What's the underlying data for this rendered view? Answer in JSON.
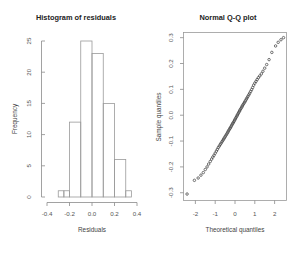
{
  "figure": {
    "width": 304,
    "height": 272,
    "background": "#ffffff",
    "panel_count": 2
  },
  "chart_data": [
    {
      "type": "bar",
      "name": "histogram-residuals",
      "title": "Histogram of residuals",
      "xlabel": "Residuals",
      "ylabel": "Frequency",
      "xlim": [
        -0.4,
        0.4
      ],
      "ylim": [
        0,
        25
      ],
      "xticks": [
        -0.4,
        -0.2,
        0.0,
        0.2,
        0.4
      ],
      "xticklabels": [
        "-0.4",
        "-0.2",
        "0.0",
        "0.2",
        "0.4"
      ],
      "yticks": [
        0,
        5,
        10,
        15,
        20,
        25
      ],
      "yticklabels": [
        "0",
        "5",
        "10",
        "15",
        "20",
        "25"
      ],
      "grid": false,
      "bin_edges": [
        -0.3,
        -0.25,
        -0.2,
        -0.15,
        -0.1,
        -0.05,
        0.0,
        0.05,
        0.1,
        0.15,
        0.2,
        0.25,
        0.3,
        0.35
      ],
      "bins": [
        {
          "left": -0.3,
          "right": -0.25,
          "count": 1
        },
        {
          "left": -0.25,
          "right": -0.2,
          "count": 1
        },
        {
          "left": -0.2,
          "right": -0.1,
          "count": 12
        },
        {
          "left": -0.1,
          "right": 0.0,
          "count": 25
        },
        {
          "left": 0.0,
          "right": 0.1,
          "count": 23
        },
        {
          "left": 0.1,
          "right": 0.2,
          "count": 15
        },
        {
          "left": 0.2,
          "right": 0.3,
          "count": 6
        },
        {
          "left": 0.3,
          "right": 0.35,
          "count": 1
        }
      ],
      "categories": [
        "-0.275",
        "-0.15",
        "-0.05",
        "0.05",
        "0.15",
        "0.25",
        "0.325"
      ],
      "values": [
        1,
        12,
        25,
        23,
        15,
        6,
        1
      ]
    },
    {
      "type": "scatter",
      "name": "normal-qq-plot",
      "title": "Normal Q-Q plot",
      "xlabel": "Theoretical quantiles",
      "ylabel": "Sample quantiles",
      "xlim": [
        -2.6,
        2.6
      ],
      "ylim": [
        -0.33,
        0.32
      ],
      "xticks": [
        -2,
        -1,
        0,
        1,
        2
      ],
      "xticklabels": [
        "-2",
        "-1",
        "0",
        "1",
        "2"
      ],
      "yticks": [
        -0.3,
        -0.2,
        -0.1,
        0.0,
        0.1,
        0.2,
        0.3
      ],
      "yticklabels": [
        "-0.3",
        "-0.2",
        "-0.1",
        "0.0",
        "0.1",
        "0.2",
        "0.3"
      ],
      "grid": false,
      "frame": true,
      "marker": "open-circle",
      "points": [
        [
          -2.42,
          -0.305
        ],
        [
          -2.05,
          -0.252
        ],
        [
          -1.86,
          -0.243
        ],
        [
          -1.72,
          -0.232
        ],
        [
          -1.6,
          -0.222
        ],
        [
          -1.5,
          -0.21
        ],
        [
          -1.41,
          -0.2
        ],
        [
          -1.33,
          -0.189
        ],
        [
          -1.25,
          -0.179
        ],
        [
          -1.18,
          -0.17
        ],
        [
          -1.12,
          -0.162
        ],
        [
          -1.06,
          -0.155
        ],
        [
          -1.0,
          -0.147
        ],
        [
          -0.94,
          -0.139
        ],
        [
          -0.89,
          -0.132
        ],
        [
          -0.84,
          -0.125
        ],
        [
          -0.79,
          -0.119
        ],
        [
          -0.74,
          -0.113
        ],
        [
          -0.7,
          -0.108
        ],
        [
          -0.65,
          -0.102
        ],
        [
          -0.61,
          -0.097
        ],
        [
          -0.57,
          -0.092
        ],
        [
          -0.53,
          -0.087
        ],
        [
          -0.49,
          -0.082
        ],
        [
          -0.45,
          -0.077
        ],
        [
          -0.41,
          -0.072
        ],
        [
          -0.37,
          -0.067
        ],
        [
          -0.34,
          -0.062
        ],
        [
          -0.3,
          -0.057
        ],
        [
          -0.26,
          -0.052
        ],
        [
          -0.23,
          -0.048
        ],
        [
          -0.19,
          -0.043
        ],
        [
          -0.16,
          -0.038
        ],
        [
          -0.12,
          -0.033
        ],
        [
          -0.09,
          -0.029
        ],
        [
          -0.05,
          -0.024
        ],
        [
          -0.02,
          -0.019
        ],
        [
          0.02,
          -0.014
        ],
        [
          0.05,
          -0.009
        ],
        [
          0.09,
          -0.004
        ],
        [
          0.12,
          0.001
        ],
        [
          0.16,
          0.006
        ],
        [
          0.19,
          0.011
        ],
        [
          0.23,
          0.016
        ],
        [
          0.26,
          0.021
        ],
        [
          0.3,
          0.026
        ],
        [
          0.34,
          0.031
        ],
        [
          0.37,
          0.036
        ],
        [
          0.41,
          0.041
        ],
        [
          0.45,
          0.046
        ],
        [
          0.49,
          0.051
        ],
        [
          0.53,
          0.056
        ],
        [
          0.57,
          0.062
        ],
        [
          0.61,
          0.067
        ],
        [
          0.65,
          0.073
        ],
        [
          0.7,
          0.079
        ],
        [
          0.74,
          0.085
        ],
        [
          0.79,
          0.092
        ],
        [
          0.84,
          0.099
        ],
        [
          0.89,
          0.107
        ],
        [
          0.94,
          0.116
        ],
        [
          1.0,
          0.124
        ],
        [
          1.06,
          0.131
        ],
        [
          1.12,
          0.138
        ],
        [
          1.18,
          0.145
        ],
        [
          1.25,
          0.152
        ],
        [
          1.33,
          0.16
        ],
        [
          1.41,
          0.17
        ],
        [
          1.5,
          0.182
        ],
        [
          1.6,
          0.196
        ],
        [
          1.72,
          0.215
        ],
        [
          1.86,
          0.243
        ],
        [
          2.05,
          0.268
        ],
        [
          2.18,
          0.282
        ],
        [
          2.32,
          0.292
        ],
        [
          2.45,
          0.3
        ]
      ]
    }
  ]
}
